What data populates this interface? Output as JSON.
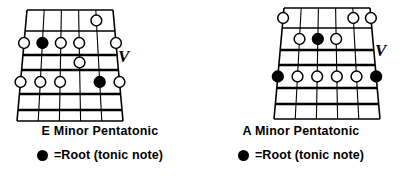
{
  "page": {
    "background_color": "#ffffff",
    "ink_color": "#000000"
  },
  "legend": {
    "dot_icon": "filled-circle-icon",
    "text": "=Root (tonic note)"
  },
  "diagrams": [
    {
      "id": "e-minor-pentatonic",
      "scale_name": "E Minor Pentatonic",
      "position_marker": "V",
      "strings": 6,
      "frets": 5,
      "notes": [
        {
          "string": 4,
          "fret": 3,
          "type": "note"
        },
        {
          "string": 1,
          "fret": 4,
          "type": "note"
        },
        {
          "string": 2,
          "fret": 4,
          "type": "note"
        },
        {
          "string": 3,
          "fret": 4,
          "type": "note"
        },
        {
          "string": 5,
          "fret": 4,
          "type": "root"
        },
        {
          "string": 6,
          "fret": 4,
          "type": "note"
        },
        {
          "string": 1,
          "fret": 2,
          "type": "note"
        },
        {
          "string": 2,
          "fret": 2,
          "type": "root"
        },
        {
          "string": 3,
          "fret": 2,
          "type": "note"
        },
        {
          "string": 4,
          "fret": 2,
          "type": "note"
        },
        {
          "string": 6,
          "fret": 2,
          "type": "note"
        },
        {
          "string": 5,
          "fret": 1,
          "type": "note"
        }
      ]
    },
    {
      "id": "a-minor-pentatonic",
      "scale_name": "A Minor Pentatonic",
      "position_marker": "V",
      "strings": 6,
      "frets": 5,
      "notes": [
        {
          "string": 1,
          "fret": 4,
          "type": "root"
        },
        {
          "string": 2,
          "fret": 4,
          "type": "note"
        },
        {
          "string": 3,
          "fret": 4,
          "type": "note"
        },
        {
          "string": 4,
          "fret": 4,
          "type": "note"
        },
        {
          "string": 5,
          "fret": 4,
          "type": "note"
        },
        {
          "string": 6,
          "fret": 4,
          "type": "root"
        },
        {
          "string": 2,
          "fret": 2,
          "type": "note"
        },
        {
          "string": 3,
          "fret": 2,
          "type": "root"
        },
        {
          "string": 4,
          "fret": 2,
          "type": "note"
        },
        {
          "string": 1,
          "fret": 1,
          "type": "note"
        },
        {
          "string": 5,
          "fret": 1,
          "type": "note"
        },
        {
          "string": 6,
          "fret": 1,
          "type": "note"
        }
      ]
    }
  ]
}
